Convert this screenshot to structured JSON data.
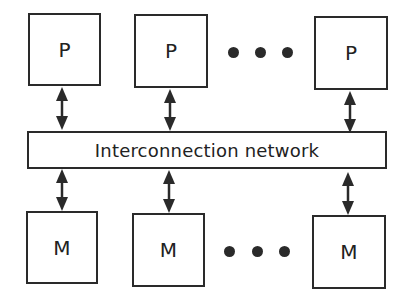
{
  "diagram": {
    "type": "shared-memory multiprocessor architecture",
    "processors": [
      {
        "label": "P"
      },
      {
        "label": "P"
      },
      {
        "label": "P"
      }
    ],
    "network": {
      "label": "Interconnection network"
    },
    "memories": [
      {
        "label": "M"
      },
      {
        "label": "M"
      },
      {
        "label": "M"
      }
    ],
    "ellipsis": "• • •",
    "connections": [
      {
        "from": "processor-1",
        "to": "network",
        "arrow": "bidirectional"
      },
      {
        "from": "processor-2",
        "to": "network",
        "arrow": "bidirectional"
      },
      {
        "from": "processor-3",
        "to": "network",
        "arrow": "bidirectional"
      },
      {
        "from": "network",
        "to": "memory-1",
        "arrow": "bidirectional"
      },
      {
        "from": "network",
        "to": "memory-2",
        "arrow": "bidirectional"
      },
      {
        "from": "network",
        "to": "memory-3",
        "arrow": "bidirectional"
      }
    ],
    "colors": {
      "stroke": "#2a2a2a",
      "background": "#ffffff",
      "text": "#222222"
    }
  }
}
